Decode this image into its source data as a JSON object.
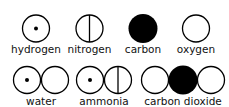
{
  "colors": {
    "stroke": "#000000",
    "fill_dark": "#000000",
    "fill_light": "#ffffff"
  },
  "atoms": [
    {
      "name": "hydrogen",
      "label": "hydrogen",
      "symbol": "circle-with-dot"
    },
    {
      "name": "nitrogen",
      "label": "nitrogen",
      "symbol": "circle-with-vertical-line"
    },
    {
      "name": "carbon",
      "label": "carbon",
      "symbol": "filled-circle"
    },
    {
      "name": "oxygen",
      "label": "oxygen",
      "symbol": "empty-circle"
    }
  ],
  "molecules": [
    {
      "name": "water",
      "label": "water",
      "components": [
        "hydrogen",
        "oxygen"
      ]
    },
    {
      "name": "ammonia",
      "label": "ammonia",
      "components": [
        "hydrogen",
        "nitrogen"
      ]
    },
    {
      "name": "carbon-dioxide",
      "label": "carbon dioxide",
      "components": [
        "oxygen",
        "carbon",
        "oxygen"
      ]
    }
  ]
}
